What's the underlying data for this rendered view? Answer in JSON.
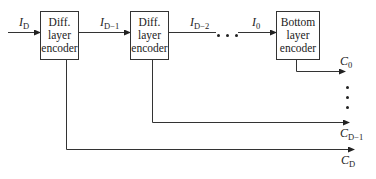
{
  "diagram": {
    "boxes": [
      {
        "id": "diff-encoder-1",
        "lines": [
          "Diff.",
          "layer",
          "encoder"
        ]
      },
      {
        "id": "diff-encoder-2",
        "lines": [
          "Diff.",
          "layer",
          "encoder"
        ]
      },
      {
        "id": "bottom-encoder",
        "lines": [
          "Bottom",
          "layer",
          "encoder"
        ]
      }
    ],
    "inputs": [
      {
        "main": "I",
        "sub": "D"
      },
      {
        "main": "I",
        "sub": "D−1"
      },
      {
        "main": "I",
        "sub": "D−2"
      },
      {
        "main": "I",
        "sub": "0"
      }
    ],
    "outputs": [
      {
        "main": "C",
        "sub": "0"
      },
      {
        "main": "C",
        "sub": "D−1"
      },
      {
        "main": "C",
        "sub": "D"
      }
    ],
    "ellipsis_horizontal": "• • •",
    "ellipsis_vertical": "⋮"
  }
}
